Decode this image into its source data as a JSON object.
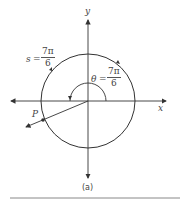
{
  "diagram": {
    "axes": {
      "x_label": "x",
      "y_label": "y"
    },
    "arc_label": {
      "var": "s",
      "eq": "=",
      "num": "7π",
      "den": "6"
    },
    "angle_label": {
      "var": "θ",
      "eq": "=",
      "num": "7π",
      "den": "6"
    },
    "point_label": "P",
    "caption": "(a)",
    "colors": {
      "stroke": "#333333",
      "text": "#444444",
      "rule": "#888888"
    }
  }
}
